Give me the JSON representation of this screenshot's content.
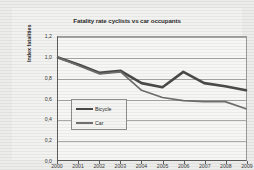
{
  "chart_data": {
    "type": "line",
    "title": "Fatality rate cyclists vs car occupants",
    "xlabel": "Year",
    "ylabel": "Index fatalities",
    "x": [
      2000,
      2001,
      2002,
      2003,
      2004,
      2005,
      2006,
      2007,
      2008,
      2009
    ],
    "categories": [
      "2000",
      "2001",
      "2002",
      "2003",
      "2004",
      "2005",
      "2006",
      "2007",
      "2008",
      "2009"
    ],
    "series": [
      {
        "name": "Bicycle",
        "color": "#4a4a4a",
        "values": [
          1.0,
          0.93,
          0.85,
          0.87,
          0.75,
          0.71,
          0.86,
          0.75,
          0.72,
          0.68
        ]
      },
      {
        "name": "Car",
        "color": "#6e6e6e",
        "values": [
          1.0,
          0.92,
          0.84,
          0.86,
          0.68,
          0.61,
          0.58,
          0.57,
          0.57,
          0.5
        ]
      }
    ],
    "ylim": [
      0.0,
      1.2
    ],
    "yticks": [
      "0,0",
      "0,2",
      "0,4",
      "0,6",
      "0,8",
      "1,0",
      "1,2"
    ],
    "ytick_values": [
      0.0,
      0.2,
      0.4,
      0.6,
      0.8,
      1.0,
      1.2
    ],
    "xlim": [
      2000,
      2009
    ],
    "grid": "horizontal",
    "legend_position": "lower-left-inside",
    "legend_entries": [
      "Bicycle",
      "Car"
    ]
  },
  "figure": {
    "background_color": "#ececeb",
    "plot_background_color": "#f6f6f4",
    "gridline_color": "#a9a9a9",
    "axis_color": "#5d5d5d"
  }
}
